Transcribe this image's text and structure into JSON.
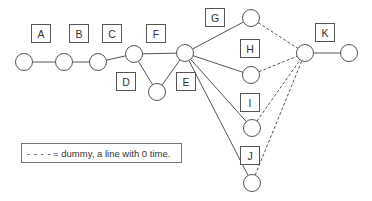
{
  "diagram": {
    "type": "activity-network",
    "nodes": [
      {
        "id": "n1",
        "x": 24,
        "y": 62
      },
      {
        "id": "n2",
        "x": 64,
        "y": 62
      },
      {
        "id": "n3",
        "x": 98,
        "y": 62
      },
      {
        "id": "n4",
        "x": 134,
        "y": 54
      },
      {
        "id": "n5",
        "x": 157,
        "y": 92
      },
      {
        "id": "n6",
        "x": 185,
        "y": 53
      },
      {
        "id": "n7",
        "x": 251,
        "y": 18
      },
      {
        "id": "n8",
        "x": 251,
        "y": 75
      },
      {
        "id": "n9",
        "x": 252,
        "y": 128
      },
      {
        "id": "n10",
        "x": 252,
        "y": 183
      },
      {
        "id": "n11",
        "x": 305,
        "y": 53
      },
      {
        "id": "n12",
        "x": 349,
        "y": 53
      }
    ],
    "edges": [
      {
        "from": "n1",
        "to": "n2",
        "label": "A",
        "style": "solid"
      },
      {
        "from": "n2",
        "to": "n3",
        "label": "B",
        "style": "solid"
      },
      {
        "from": "n3",
        "to": "n4",
        "label": "C",
        "style": "solid"
      },
      {
        "from": "n4",
        "to": "n6",
        "label": "F",
        "style": "solid"
      },
      {
        "from": "n4",
        "to": "n5",
        "label": "D",
        "style": "solid"
      },
      {
        "from": "n5",
        "to": "n6",
        "label": "E",
        "style": "solid"
      },
      {
        "from": "n6",
        "to": "n7",
        "label": "G",
        "style": "solid"
      },
      {
        "from": "n6",
        "to": "n8",
        "label": "H",
        "style": "solid"
      },
      {
        "from": "n6",
        "to": "n9",
        "label": "I",
        "style": "solid"
      },
      {
        "from": "n6",
        "to": "n10",
        "label": "J",
        "style": "solid"
      },
      {
        "from": "n7",
        "to": "n11",
        "label": "",
        "style": "dashed"
      },
      {
        "from": "n8",
        "to": "n11",
        "label": "",
        "style": "dashed"
      },
      {
        "from": "n9",
        "to": "n11",
        "label": "",
        "style": "dashed"
      },
      {
        "from": "n10",
        "to": "n11",
        "label": "",
        "style": "dashed"
      },
      {
        "from": "n11",
        "to": "n12",
        "label": "K",
        "style": "solid"
      }
    ],
    "labels": {
      "A": "A",
      "B": "B",
      "C": "C",
      "D": "D",
      "E": "E",
      "F": "F",
      "G": "G",
      "H": "H",
      "I": "I",
      "J": "J",
      "K": "K"
    },
    "colors": {
      "line": "#555555",
      "node_stroke": "#555555",
      "text": "#333333",
      "background": "#ffffff"
    }
  },
  "legend": {
    "symbol": "- - - -",
    "text": "= dummy, a line with 0 time."
  }
}
